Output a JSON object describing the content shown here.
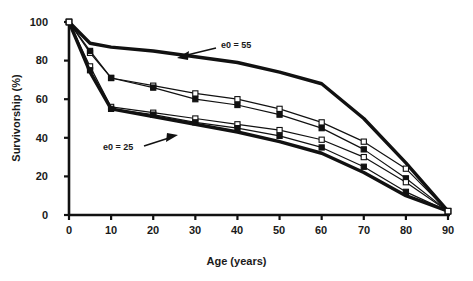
{
  "chart_data": {
    "type": "line",
    "title": "",
    "xlabel": "Age (years)",
    "ylabel": "Survivorship (%)",
    "xlim": [
      0,
      90
    ],
    "ylim": [
      0,
      100
    ],
    "xticks": [
      0,
      10,
      20,
      30,
      40,
      50,
      60,
      70,
      80,
      90
    ],
    "yticks": [
      0,
      20,
      40,
      60,
      80,
      100
    ],
    "grid": false,
    "legend_position": "none",
    "x": [
      0,
      5,
      10,
      20,
      30,
      40,
      50,
      60,
      70,
      80,
      90
    ],
    "series": [
      {
        "name": "e0 = 55",
        "style": "thick-line",
        "marker": "none",
        "color": "#111111",
        "values": [
          100,
          89,
          87,
          85,
          82,
          79,
          74,
          68,
          50,
          27,
          2
        ]
      },
      {
        "name": "model-life-table-open-square-upper",
        "style": "thin-line",
        "marker": "open-square",
        "color": "#111111",
        "values": [
          100,
          84,
          71,
          67,
          63,
          60,
          55,
          48,
          38,
          24,
          2
        ]
      },
      {
        "name": "model-life-table-filled-square-upper",
        "style": "thin-line",
        "marker": "filled-square",
        "color": "#111111",
        "values": [
          100,
          85,
          71,
          66,
          60,
          57,
          52,
          45,
          34,
          19,
          2
        ]
      },
      {
        "name": "model-life-table-open-square-lower",
        "style": "thin-line",
        "marker": "open-square",
        "color": "#111111",
        "values": [
          100,
          77,
          56,
          53,
          50,
          47,
          44,
          39,
          30,
          17,
          2
        ]
      },
      {
        "name": "model-life-table-filled-square-lower",
        "style": "thin-line",
        "marker": "filled-square",
        "color": "#111111",
        "values": [
          100,
          75,
          55,
          52,
          48,
          45,
          41,
          35,
          25,
          12,
          2
        ]
      },
      {
        "name": "e0 = 25",
        "style": "thick-line",
        "marker": "none",
        "color": "#111111",
        "values": [
          100,
          74,
          55,
          51,
          47,
          43,
          38,
          32,
          22,
          10,
          2
        ]
      }
    ],
    "annotations": [
      {
        "text": "e0 = 55",
        "x": 38,
        "y": 90,
        "arrow": "left-down"
      },
      {
        "text": "e0 = 25",
        "x": 15,
        "y": 31,
        "arrow": "right-up"
      }
    ]
  },
  "axis": {
    "ylabel": "Survivorship (%)",
    "xlabel": "Age (years)",
    "xtick_labels": [
      "0",
      "10",
      "20",
      "30",
      "40",
      "50",
      "60",
      "70",
      "80",
      "90"
    ],
    "ytick_labels": [
      "0",
      "20",
      "40",
      "60",
      "80",
      "100"
    ]
  },
  "annotations": {
    "upper_label": "e0 = 55",
    "lower_label": "e0 = 25"
  },
  "colors": {
    "ink": "#111111",
    "background": "#ffffff"
  }
}
